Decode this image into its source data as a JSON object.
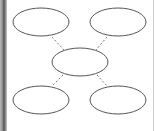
{
  "diagram": {
    "type": "bubble-map",
    "colors": {
      "background": "#ffffff",
      "node_stroke": "#555555",
      "connector_stroke": "#777777",
      "left_bar": "#555555",
      "right_border": "#cfcfcf"
    },
    "center_node": {
      "id": "center",
      "label": "",
      "cx": 80,
      "cy": 62,
      "rx": 28,
      "ry": 14
    },
    "nodes": [
      {
        "id": "top-left",
        "label": "",
        "cx": 41,
        "cy": 22,
        "rx": 28,
        "ry": 14
      },
      {
        "id": "top-right",
        "label": "",
        "cx": 118,
        "cy": 22,
        "rx": 28,
        "ry": 14
      },
      {
        "id": "bottom-left",
        "label": "",
        "cx": 41,
        "cy": 100,
        "rx": 28,
        "ry": 14
      },
      {
        "id": "bottom-right",
        "label": "",
        "cx": 118,
        "cy": 100,
        "rx": 28,
        "ry": 14
      }
    ],
    "connectors": [
      {
        "from": "top-left",
        "to": "center",
        "x1": 52,
        "y1": 37,
        "x2": 64,
        "y2": 50,
        "style": "dashed"
      },
      {
        "from": "top-right",
        "to": "center",
        "x1": 107,
        "y1": 37,
        "x2": 96,
        "y2": 50,
        "style": "dashed"
      },
      {
        "from": "center",
        "to": "bottom-left",
        "x1": 63,
        "y1": 75,
        "x2": 52,
        "y2": 86,
        "style": "dashed"
      },
      {
        "from": "center",
        "to": "bottom-right",
        "x1": 97,
        "y1": 75,
        "x2": 107,
        "y2": 86,
        "style": "dashed"
      }
    ]
  }
}
